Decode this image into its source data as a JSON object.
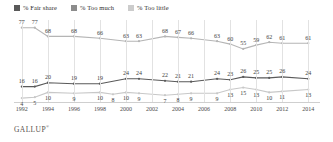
{
  "legend": {
    "items": [
      {
        "label": "% Fair share",
        "color": "#595959",
        "icon": "legend-swatch"
      },
      {
        "label": "% Too much",
        "color": "#8c8c8c",
        "icon": "legend-swatch"
      },
      {
        "label": "% Too little",
        "color": "#cccccc",
        "icon": "legend-swatch"
      }
    ]
  },
  "footer": {
    "brand": "GALLUP",
    "trademark": "®"
  },
  "chart_data": {
    "type": "line",
    "title": "",
    "subtitle": "",
    "xlabel": "",
    "ylabel": "",
    "ylim": [
      0,
      85
    ],
    "grid": "vertical",
    "legend_position": "top-left",
    "x": [
      1992,
      1993,
      1994,
      1996,
      1998,
      1999,
      2000,
      2001,
      2002,
      2003,
      2004,
      2005,
      2006,
      2007,
      2008,
      2009,
      2010,
      2011,
      2012,
      2013,
      2014
    ],
    "xtick_labels": [
      "1992",
      "1994",
      "1996",
      "1998",
      "2000",
      "2002",
      "2004",
      "2006",
      "2008",
      "2010",
      "2012",
      "2014"
    ],
    "xtick_values": [
      1992,
      1994,
      1996,
      1998,
      2000,
      2002,
      2004,
      2006,
      2008,
      2010,
      2012,
      2014
    ],
    "series": [
      {
        "name": "% Too little",
        "color": "#b5b5b5",
        "values": [
          77,
          77,
          68,
          68,
          66,
          63,
          63,
          68,
          67,
          66,
          63,
          60,
          55,
          59,
          62,
          61,
          61
        ],
        "x": [
          1992,
          1993,
          1994,
          1996,
          1998,
          2000,
          2001,
          2003,
          2004,
          2005,
          2007,
          2008,
          2009,
          2010,
          2011,
          2012,
          2014
        ]
      },
      {
        "name": "% Too much",
        "color": "#5a5a5a",
        "values": [
          16,
          16,
          20,
          19,
          19,
          24,
          24,
          22,
          21,
          21,
          24,
          23,
          26,
          25,
          25,
          26,
          24
        ],
        "x": [
          1992,
          1993,
          1994,
          1996,
          1998,
          2000,
          2001,
          2003,
          2004,
          2005,
          2007,
          2008,
          2009,
          2010,
          2011,
          2012,
          2014
        ]
      },
      {
        "name": "% Fair share",
        "color": "#c8c8c8",
        "values": [
          4,
          5,
          10,
          9,
          10,
          8,
          10,
          9,
          7,
          8,
          9,
          9,
          13,
          15,
          13,
          10,
          11,
          13
        ],
        "x": [
          1992,
          1993,
          1994,
          1996,
          1998,
          1999,
          2000,
          2001,
          2003,
          2004,
          2005,
          2007,
          2008,
          2009,
          2010,
          2011,
          2012,
          2014
        ]
      }
    ]
  }
}
